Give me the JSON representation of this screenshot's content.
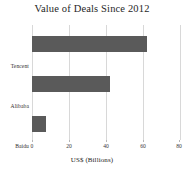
{
  "chart_data": {
    "type": "bar",
    "orientation": "horizontal",
    "title": "Value of Deals Since 2012",
    "xlabel": "US$ (Billions)",
    "ylabel": "",
    "categories": [
      "Tencent",
      "Alibaba",
      "Baidu"
    ],
    "values": [
      62,
      42,
      7.5
    ],
    "xlim": [
      0,
      80
    ],
    "xticks": [
      0,
      20,
      40,
      60,
      80
    ],
    "xtick_labels": [
      "0",
      "20",
      "40",
      "60",
      "80"
    ],
    "grid": true,
    "grid_axis": "x",
    "legend": false,
    "bar_color": "#5a5a5a",
    "background_color": "#ffffff",
    "gridline_color": "#d8d8d8"
  }
}
